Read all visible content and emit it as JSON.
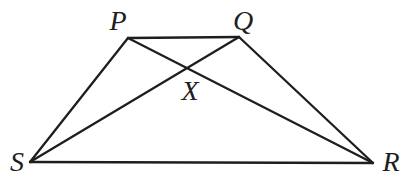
{
  "figure": {
    "canvas": {
      "width": 407,
      "height": 192,
      "background": "#ffffff"
    },
    "style": {
      "stroke_color": "#1e1e1e",
      "stroke_width": 2.3,
      "label_font_size": 28,
      "label_color": "#1e1e1e"
    },
    "points": {
      "P": {
        "x": 128,
        "y": 38
      },
      "Q": {
        "x": 239,
        "y": 37
      },
      "R": {
        "x": 373,
        "y": 163
      },
      "S": {
        "x": 30,
        "y": 162
      },
      "X": {
        "x": 187,
        "y": 68
      }
    },
    "segments": [
      {
        "from": "P",
        "to": "Q"
      },
      {
        "from": "P",
        "to": "S"
      },
      {
        "from": "Q",
        "to": "R"
      },
      {
        "from": "S",
        "to": "R"
      },
      {
        "from": "P",
        "to": "R"
      },
      {
        "from": "S",
        "to": "Q"
      }
    ],
    "labels": [
      {
        "text": "P",
        "x": 118,
        "y": 30
      },
      {
        "text": "Q",
        "x": 243,
        "y": 30
      },
      {
        "text": "R",
        "x": 391,
        "y": 171
      },
      {
        "text": "S",
        "x": 17,
        "y": 171
      },
      {
        "text": "X",
        "x": 190,
        "y": 100
      }
    ]
  }
}
